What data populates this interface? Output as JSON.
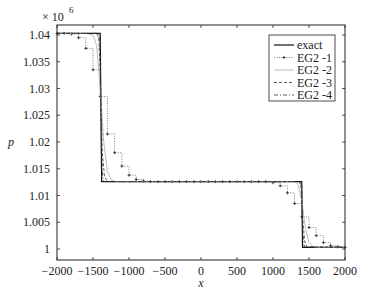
{
  "chart_data": {
    "type": "line",
    "title": "",
    "xlabel": "x",
    "ylabel": "p",
    "y_multiplier": "× 10",
    "y_multiplier_exp": "6",
    "xlim": [
      -2000,
      2000
    ],
    "ylim": [
      0.9995,
      1.0415
    ],
    "xticks": [
      -2000,
      -1500,
      -1000,
      -500,
      0,
      500,
      1000,
      1500,
      2000
    ],
    "xtick_labels": [
      "−2000",
      "−1500",
      "−1000",
      "−500",
      "0",
      "500",
      "1000",
      "1500",
      "2000"
    ],
    "yticks": [
      1,
      1.005,
      1.01,
      1.015,
      1.02,
      1.025,
      1.03,
      1.035,
      1.04
    ],
    "ytick_labels": [
      "1",
      "1.005",
      "1.01",
      "1.015",
      "1.02",
      "1.025",
      "1.03",
      "1.035",
      "1.04"
    ],
    "grid": false,
    "legend_position": "upper right",
    "series": [
      {
        "name": "exact",
        "style": "solid",
        "x": [
          -2000,
          -1400,
          -1380,
          1400,
          1410,
          2000
        ],
        "y": [
          1.0403,
          1.0403,
          1.0126,
          1.0126,
          1.0003,
          1.0003
        ]
      },
      {
        "name": "EG2 -1",
        "style": "dotted-markers",
        "x": [
          -2000,
          -1900,
          -1800,
          -1700,
          -1600,
          -1500,
          -1400,
          -1300,
          -1200,
          -1100,
          -1000,
          -900,
          -800,
          -700,
          -600,
          -500,
          -400,
          -300,
          -200,
          -100,
          0,
          100,
          200,
          300,
          400,
          500,
          600,
          700,
          800,
          900,
          1000,
          1100,
          1200,
          1300,
          1400,
          1500,
          1600,
          1700,
          1800,
          1900,
          2000
        ],
        "y": [
          1.0403,
          1.0403,
          1.0402,
          1.0395,
          1.0375,
          1.0335,
          1.0285,
          1.0215,
          1.018,
          1.0155,
          1.0138,
          1.013,
          1.0127,
          1.0126,
          1.0126,
          1.0126,
          1.0126,
          1.0126,
          1.0126,
          1.0126,
          1.0126,
          1.0126,
          1.0126,
          1.0126,
          1.0126,
          1.0126,
          1.0126,
          1.0126,
          1.0126,
          1.0126,
          1.0124,
          1.0118,
          1.0105,
          1.0085,
          1.006,
          1.004,
          1.0025,
          1.0012,
          1.0006,
          1.0004,
          1.0003
        ]
      },
      {
        "name": "EG2 -2",
        "style": "light-solid",
        "x": [
          -2000,
          -1600,
          -1500,
          -1450,
          -1400,
          -1350,
          -1300,
          -1250,
          -1200,
          1300,
          1350,
          1400,
          1450,
          1500,
          1550,
          1600,
          2000
        ],
        "y": [
          1.0403,
          1.0403,
          1.04,
          1.038,
          1.03,
          1.02,
          1.0145,
          1.013,
          1.0126,
          1.0126,
          1.012,
          1.009,
          1.004,
          1.0012,
          1.0005,
          1.0003,
          1.0003
        ]
      },
      {
        "name": "EG2 -3",
        "style": "dashed",
        "x": [
          -2000,
          -1450,
          -1420,
          -1400,
          -1370,
          -1340,
          -1300,
          1360,
          1390,
          1410,
          1440,
          1470,
          2000
        ],
        "y": [
          1.0403,
          1.0403,
          1.0395,
          1.033,
          1.018,
          1.0135,
          1.0126,
          1.0126,
          1.0115,
          1.006,
          1.0015,
          1.0004,
          1.0003
        ]
      },
      {
        "name": "EG2 -4",
        "style": "dash-dot",
        "x": [
          -2000,
          -1420,
          -1400,
          -1385,
          -1365,
          -1350,
          1385,
          1400,
          1415,
          1435,
          2000
        ],
        "y": [
          1.0403,
          1.0403,
          1.037,
          1.02,
          1.0135,
          1.0126,
          1.0126,
          1.0105,
          1.003,
          1.0004,
          1.0003
        ]
      }
    ]
  }
}
